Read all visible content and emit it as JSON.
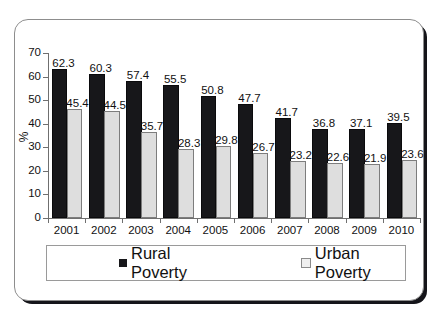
{
  "chart_data": {
    "type": "bar",
    "title": "",
    "xlabel": "",
    "ylabel": "%",
    "ylim": [
      0,
      70
    ],
    "yticks": [
      0,
      10,
      20,
      30,
      40,
      50,
      60,
      70
    ],
    "grid": false,
    "legend_position": "bottom",
    "categories": [
      "2001",
      "2002",
      "2003",
      "2004",
      "2005",
      "2006",
      "2007",
      "2008",
      "2009",
      "2010"
    ],
    "series": [
      {
        "name": "Rural Poverty",
        "color": "#17171a",
        "values": [
          62.3,
          60.3,
          57.4,
          55.5,
          50.8,
          47.7,
          41.7,
          36.8,
          37.1,
          39.5
        ],
        "labels": [
          "62.3",
          "60.3",
          "57.4",
          "55.5",
          "50.8",
          "47.7",
          "41.7",
          "36.8",
          "37.1",
          "39.5"
        ]
      },
      {
        "name": "Urban Poverty",
        "color": "#dedede",
        "values": [
          45.4,
          44.5,
          35.7,
          28.3,
          29.8,
          26.7,
          23.2,
          22.6,
          21.9,
          23.6
        ],
        "labels": [
          "45.4",
          "44.5",
          "35.7",
          "28.3",
          "29.8",
          "26.7",
          "23.2",
          "22.6",
          "21.9",
          "23.6"
        ]
      }
    ]
  },
  "legend": {
    "rural_label": "Rural Poverty",
    "urban_label": "Urban Poverty"
  },
  "axis": {
    "y_title": "%"
  }
}
